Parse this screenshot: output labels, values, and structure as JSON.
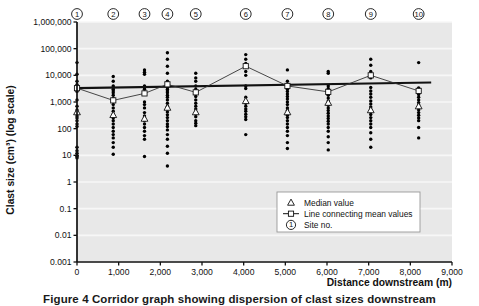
{
  "figure": {
    "caption_prefix": "Figure 4",
    "caption_text": "Corridor graph showing dispersion of clast sizes downstream",
    "caption_full": "Figure 4 Corridor graph showing dispersion of clast sizes downstream"
  },
  "legend": {
    "items": [
      {
        "marker": "triangle-outline",
        "label": "Median value"
      },
      {
        "marker": "line-with-square",
        "label": "Line connecting mean values"
      },
      {
        "marker": "circled-one",
        "label": "Site no."
      }
    ],
    "circled_one_glyph": "1"
  },
  "colors": {
    "plot_background": "#e8e8e8",
    "axis": "#111111",
    "gridline": "#f7f7f7",
    "data_point": "#000000",
    "trend_line": "#111111",
    "mean_line": "#333333",
    "legend_background": "#ffffff",
    "page_background": "#ffffff"
  },
  "chart_data": {
    "type": "scatter",
    "title": "",
    "xlabel": "Distance downstream (m)",
    "ylabel": "Clast size (cm³) (log scale)",
    "xlim": [
      0,
      9000
    ],
    "ylim": [
      0.001,
      1000000
    ],
    "yscale": "log",
    "grid": true,
    "legend_position": "bottom-right",
    "xticks": [
      0,
      1000,
      2000,
      3000,
      4000,
      5000,
      6000,
      7000,
      8000,
      9000
    ],
    "xticklabels": [
      "0",
      "1,000",
      "2,000",
      "3,000",
      "4,000",
      "5,000",
      "6,000",
      "7,000",
      "8,000",
      "9,000"
    ],
    "yticks": [
      0.001,
      0.01,
      0.1,
      1,
      10,
      100,
      1000,
      10000,
      100000,
      1000000
    ],
    "yticklabels": [
      "0.001",
      "0.01",
      "0.1",
      "1",
      "10",
      "100",
      "1,000",
      "10,000",
      "100,000",
      "1,000,000"
    ],
    "sites": [
      {
        "site_no": 1,
        "label": "1",
        "distance_m": 0,
        "mean": 3300,
        "median": 420,
        "values": [
          30000,
          11000,
          6000,
          4500,
          3500,
          3000,
          2500,
          1200,
          700,
          500,
          400,
          300,
          250,
          200,
          150,
          120,
          20,
          15,
          12,
          10,
          9,
          8
        ]
      },
      {
        "site_no": 2,
        "label": "2",
        "distance_m": 870,
        "mean": 1150,
        "median": 330,
        "values": [
          9000,
          6000,
          4000,
          3500,
          3000,
          2600,
          2200,
          1800,
          1400,
          1000,
          800,
          600,
          450,
          350,
          300,
          250,
          200,
          150,
          110,
          80,
          60,
          45,
          30,
          20,
          11
        ]
      },
      {
        "site_no": 3,
        "label": "3",
        "distance_m": 1620,
        "mean": 2100,
        "median": 240,
        "values": [
          16000,
          13000,
          11000,
          4000,
          3400,
          3000,
          1000,
          800,
          600,
          400,
          300,
          250,
          200,
          150,
          110,
          80,
          55,
          40,
          9
        ]
      },
      {
        "site_no": 4,
        "label": "4",
        "distance_m": 2170,
        "mean": 4600,
        "median": 620,
        "values": [
          70000,
          40000,
          22000,
          12000,
          6000,
          4500,
          3500,
          3000,
          2600,
          2200,
          1800,
          1500,
          1200,
          900,
          700,
          550,
          420,
          330,
          260,
          200,
          150,
          120,
          90,
          60,
          40,
          22,
          12,
          4
        ]
      },
      {
        "site_no": 5,
        "label": "5",
        "distance_m": 2850,
        "mean": 2300,
        "median": 420,
        "values": [
          12000,
          8000,
          6000,
          4000,
          3000,
          2400,
          2000,
          1600,
          1200,
          900,
          700,
          550,
          430,
          350,
          280,
          200,
          160,
          130
        ]
      },
      {
        "site_no": 6,
        "label": "6",
        "distance_m": 4050,
        "mean": 22000,
        "median": 1100,
        "values": [
          60000,
          40000,
          28000,
          20000,
          14000,
          10000,
          4000,
          3200,
          1500,
          1100,
          900,
          700,
          550,
          450,
          350,
          280,
          220,
          60
        ]
      },
      {
        "site_no": 7,
        "label": "7",
        "distance_m": 5050,
        "mean": 4000,
        "median": 420,
        "values": [
          16000,
          6000,
          4200,
          3600,
          3000,
          2500,
          2000,
          1600,
          1300,
          1000,
          800,
          600,
          480,
          400,
          320,
          260,
          200,
          150,
          110,
          80,
          55,
          30,
          18
        ]
      },
      {
        "site_no": 8,
        "label": "8",
        "distance_m": 6030,
        "mean": 2400,
        "median": 950,
        "values": [
          14000,
          12000,
          4000,
          3200,
          2400,
          1800,
          1400,
          1100,
          900,
          750,
          600,
          480,
          380,
          300,
          240,
          190,
          150,
          110,
          80,
          50,
          30,
          16
        ]
      },
      {
        "site_no": 9,
        "label": "9",
        "distance_m": 7050,
        "mean": 10000,
        "median": 500,
        "values": [
          40000,
          24000,
          14000,
          9000,
          8000,
          3500,
          2600,
          2000,
          1500,
          1100,
          850,
          650,
          520,
          420,
          340,
          260,
          200,
          150,
          110,
          70,
          40,
          20
        ]
      },
      {
        "site_no": 10,
        "label": "10",
        "distance_m": 8200,
        "mean": 2600,
        "median": 700,
        "values": [
          30000,
          3400,
          2400,
          1900,
          1500,
          1200,
          950,
          780,
          620,
          500,
          400,
          320,
          250,
          200,
          110,
          45
        ]
      }
    ],
    "mean_series": {
      "name": "Line connecting mean values",
      "x": [
        0,
        870,
        1620,
        2170,
        2850,
        4050,
        5050,
        6030,
        7050,
        8200
      ],
      "values": [
        3300,
        1150,
        2100,
        4600,
        2300,
        22000,
        4000,
        2400,
        10000,
        2600
      ]
    },
    "median_series": {
      "name": "Median value",
      "x": [
        0,
        870,
        1620,
        2170,
        2850,
        4050,
        5050,
        6030,
        7050,
        8200
      ],
      "values": [
        420,
        330,
        240,
        620,
        420,
        1100,
        420,
        950,
        500,
        700
      ]
    },
    "trend_line": {
      "name": "Trend line",
      "x": [
        0,
        8500
      ],
      "values": [
        3300,
        5400
      ]
    }
  }
}
